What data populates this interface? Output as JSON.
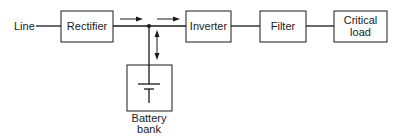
{
  "diagram": {
    "input_label": "Line",
    "blocks": {
      "rectifier": "Rectifier",
      "inverter": "Inverter",
      "filter": "Filter",
      "critical_load_line1": "Critical",
      "critical_load_line2": "load",
      "battery_line1": "Battery",
      "battery_line2": "bank"
    },
    "arrows": [
      {
        "from": "rectifier",
        "to": "junction",
        "direction": "right"
      },
      {
        "from": "junction",
        "to": "inverter",
        "direction": "right"
      },
      {
        "from": "junction",
        "to": "battery",
        "direction": "bidirectional"
      }
    ],
    "colors": {
      "stroke": "#1a1a1a",
      "background": "#ffffff"
    }
  }
}
